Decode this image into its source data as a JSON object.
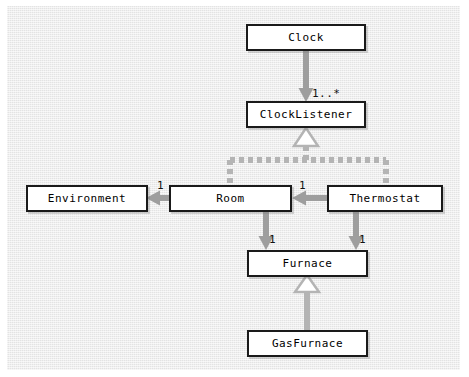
{
  "diagram": {
    "background_color": "#e9e9e9",
    "page_color": "#ffffff",
    "node_fill": "#ffffff",
    "node_border_color": "#1a1a1a",
    "connector_color": "#9e9e9e",
    "text_color": "#000000"
  },
  "nodes": {
    "clock": {
      "label": "Clock"
    },
    "clock_listener": {
      "label": "ClockListener"
    },
    "environment": {
      "label": "Environment"
    },
    "room": {
      "label": "Room"
    },
    "thermostat": {
      "label": "Thermostat"
    },
    "furnace": {
      "label": "Furnace"
    },
    "gas_furnace": {
      "label": "GasFurnace"
    }
  },
  "multiplicities": {
    "clock_to_listener": "1..*",
    "room_to_environment": "1",
    "thermostat_to_room": "1",
    "room_to_furnace": "1",
    "thermostat_to_furnace": "1"
  },
  "edges": [
    {
      "name": "clock-to-clocklistener",
      "from": "Clock",
      "to": "ClockListener",
      "style": "association-arrow",
      "label": "1..*"
    },
    {
      "name": "room-realizes-clocklistener",
      "from": "Room",
      "to": "ClockListener",
      "style": "dashed-realization"
    },
    {
      "name": "thermostat-realizes-clocklistener",
      "from": "Thermostat",
      "to": "ClockListener",
      "style": "dashed-realization"
    },
    {
      "name": "room-to-environment",
      "from": "Room",
      "to": "Environment",
      "style": "association-arrow",
      "label": "1"
    },
    {
      "name": "thermostat-to-room",
      "from": "Thermostat",
      "to": "Room",
      "style": "association-arrow",
      "label": "1"
    },
    {
      "name": "room-to-furnace",
      "from": "Room",
      "to": "Furnace",
      "style": "association-arrow",
      "label": "1"
    },
    {
      "name": "thermostat-to-furnace",
      "from": "Thermostat",
      "to": "Furnace",
      "style": "association-arrow",
      "label": "1"
    },
    {
      "name": "gasfurnace-inherits-furnace",
      "from": "GasFurnace",
      "to": "Furnace",
      "style": "generalization"
    }
  ]
}
